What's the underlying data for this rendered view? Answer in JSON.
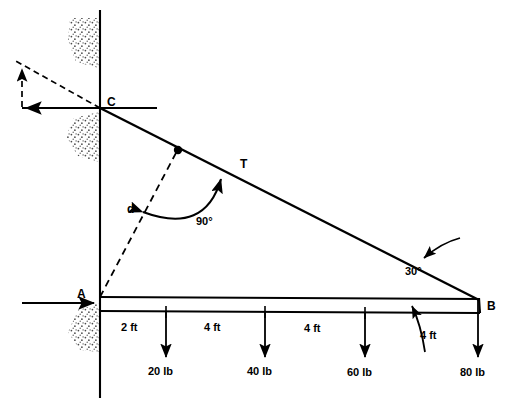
{
  "figure": {
    "colors": {
      "line": "#000000",
      "background": "#ffffff",
      "stipple": "#555555"
    },
    "points": {
      "A": {
        "label": "A",
        "x": 100,
        "y": 297
      },
      "B": {
        "label": "B",
        "x": 478,
        "y": 300
      },
      "C": {
        "label": "C",
        "x": 100,
        "y": 108
      },
      "D": {
        "label": "",
        "x": 178,
        "y": 150
      }
    },
    "labels": {
      "tension": "T",
      "distance": "d",
      "angle_right": "90°",
      "angle_beam": "30°"
    },
    "dimensions": [
      {
        "value": "2 ft",
        "x": 133,
        "y": 328
      },
      {
        "value": "4 ft",
        "x": 215,
        "y": 328
      },
      {
        "value": "4 ft",
        "x": 315,
        "y": 328
      },
      {
        "value": "4 ft",
        "x": 430,
        "y": 336
      }
    ],
    "loads": [
      {
        "label": "20 lb",
        "x": 166,
        "y": 372
      },
      {
        "label": "40 lb",
        "x": 265,
        "y": 372
      },
      {
        "label": "60 lb",
        "x": 365,
        "y": 372
      },
      {
        "label": "80 lb",
        "x": 478,
        "y": 372
      }
    ]
  }
}
